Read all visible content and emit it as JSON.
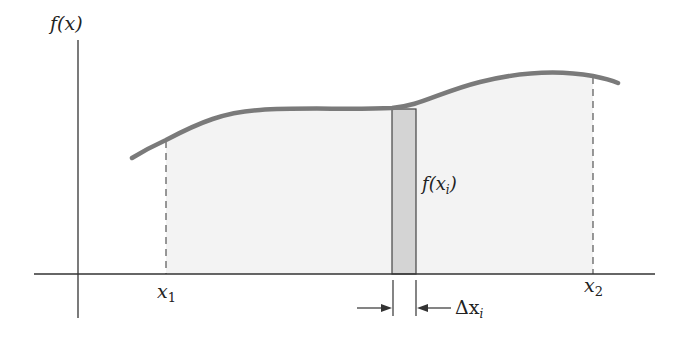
{
  "diagram": {
    "labels": {
      "y_axis": "f(x)",
      "strip_height": "f(x",
      "strip_height_sub": "i",
      "strip_height_close": ")",
      "x1": "x",
      "x1_sub": "1",
      "x2": "x",
      "x2_sub": "2",
      "delta": "Δx",
      "delta_sub": "i"
    },
    "colors": {
      "curve": "#7a7a7a",
      "area_fill": "#f3f3f3",
      "strip_fill": "#d4d4d4",
      "axis": "#333333"
    }
  }
}
